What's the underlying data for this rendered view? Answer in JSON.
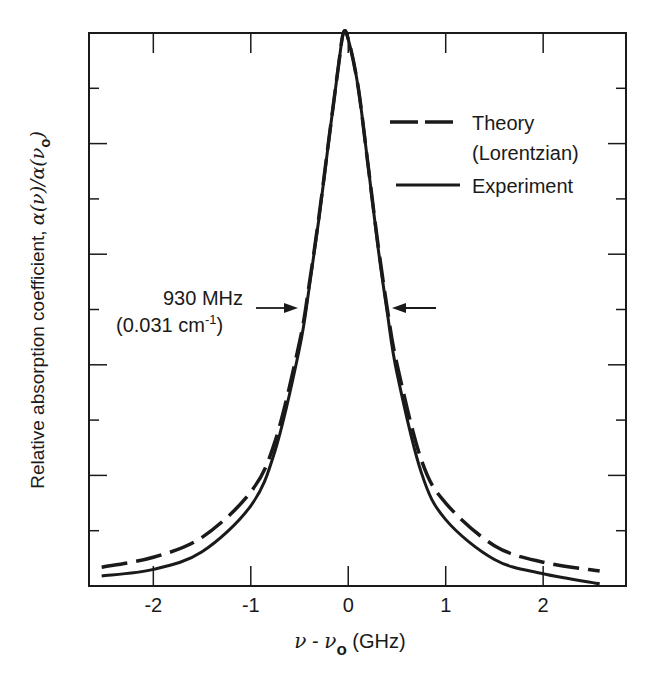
{
  "chart_data": {
    "type": "line",
    "title": "",
    "xlabel": "ν - ν_o (GHz)",
    "xlabel_parts": {
      "nu": "ν",
      "minus": " - ",
      "nu0": "ν",
      "sub": "o",
      "unit": " (GHz)"
    },
    "ylabel": "Relative absorption coefficient, α(ν)/α(ν_o)",
    "ylabel_parts": {
      "main": "Relative absorption coefficient, ",
      "expr": "α(ν)/α(ν",
      "sub": "o",
      "close": ")"
    },
    "xlim": [
      -2.66,
      2.85
    ],
    "ylim": [
      0,
      1.0
    ],
    "x_ticks": [
      -2,
      -1,
      0,
      1,
      2
    ],
    "x_tick_labels": [
      "-2",
      "-1",
      "0",
      "1",
      "2"
    ],
    "y_ticks": [
      0.1,
      0.2,
      0.3,
      0.4,
      0.5,
      0.6,
      0.7,
      0.8,
      0.9
    ],
    "y_tick_labels": [],
    "grid": false,
    "legend_position": "upper right",
    "series": [
      {
        "name": "Theory (Lorentzian)",
        "style": "dashed",
        "x": [
          -2.53,
          -2.0,
          -1.5,
          -1.0,
          -0.75,
          -0.5,
          -0.4,
          -0.3,
          -0.2,
          -0.1,
          -0.05,
          0.0,
          0.1,
          0.2,
          0.3,
          0.4,
          0.5,
          0.75,
          1.0,
          1.5,
          2.0,
          2.58
        ],
        "values": [
          0.034,
          0.052,
          0.088,
          0.17,
          0.262,
          0.441,
          0.546,
          0.669,
          0.806,
          0.941,
          1.0,
          0.989,
          0.904,
          0.766,
          0.625,
          0.502,
          0.401,
          0.228,
          0.15,
          0.073,
          0.043,
          0.027
        ]
      },
      {
        "name": "Experiment",
        "style": "solid",
        "x": [
          -2.53,
          -2.0,
          -1.5,
          -1.0,
          -0.75,
          -0.5,
          -0.4,
          -0.3,
          -0.2,
          -0.1,
          -0.05,
          0.0,
          0.1,
          0.2,
          0.3,
          0.4,
          0.5,
          0.75,
          1.0,
          1.5,
          2.0,
          2.58
        ],
        "values": [
          0.018,
          0.03,
          0.062,
          0.145,
          0.245,
          0.43,
          0.54,
          0.665,
          0.805,
          0.941,
          1.0,
          0.989,
          0.904,
          0.766,
          0.62,
          0.495,
          0.385,
          0.205,
          0.12,
          0.048,
          0.022,
          0.004
        ]
      }
    ],
    "legend": [
      {
        "label_line1": "Theory",
        "label_line2": "(Lorentzian)",
        "style": "dashed"
      },
      {
        "label_line1": "Experiment",
        "label_line2": "",
        "style": "solid"
      }
    ],
    "annotations": [
      {
        "text_line1": "930 MHz",
        "text_line2_main": "(0.031 cm",
        "text_line2_sup": "-1",
        "text_line2_close": ")",
        "meaning": "FWHM",
        "y_value": 0.5,
        "arrow_left_x": -0.5,
        "arrow_right_x": 0.43
      }
    ],
    "colors": {
      "line": "#1a1a1a",
      "background": "#ffffff"
    }
  }
}
